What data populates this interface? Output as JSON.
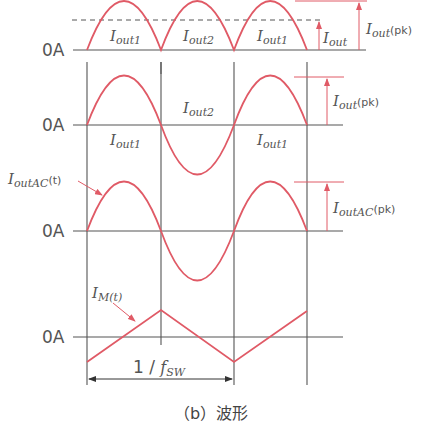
{
  "diagram": {
    "caption": "（b）波形",
    "colors": {
      "waveform": "#e05a66",
      "axis": "#555555"
    },
    "zero_label": "0A",
    "panels": [
      {
        "name": "rectified-output-current",
        "waveform": "full-wave rectified sine (|sin|)",
        "segment_labels": [
          "Iout1",
          "Iout2",
          "Iout1"
        ],
        "avg_label": {
          "main": "I",
          "sub": "out"
        },
        "peak_label": {
          "main": "I",
          "sub": "out",
          "suffix": "(pk)"
        }
      },
      {
        "name": "output-current",
        "waveform": "sine",
        "segment_labels": [
          "Iout1",
          "Iout2",
          "Iout1"
        ],
        "peak_label": {
          "main": "I",
          "sub": "out",
          "suffix": "(pk)"
        }
      },
      {
        "name": "output-ac-current",
        "waveform": "sine",
        "curve_label": {
          "main": "I",
          "sub": "outAC",
          "suffix": "(t)"
        },
        "peak_label": {
          "main": "I",
          "sub": "outAC",
          "suffix": "(pk)"
        }
      },
      {
        "name": "magnetizing-current",
        "waveform": "triangle",
        "curve_label": {
          "main": "I",
          "sub": "M(t)"
        },
        "period_label": {
          "prefix": "1 / ",
          "main": "f",
          "sub": "SW"
        }
      }
    ],
    "labels": {
      "i": "I",
      "out1": "out1",
      "out2": "out2",
      "out": "out",
      "outAC": "outAC",
      "pk": "(pk)",
      "t": "(t)",
      "mt": "M(t)",
      "period_prefix": "1 / ",
      "f": "f",
      "sw": "SW"
    }
  }
}
